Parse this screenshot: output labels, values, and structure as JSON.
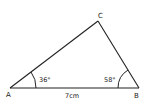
{
  "diagram": {
    "type": "triangle",
    "vertices": {
      "A": {
        "label": "A",
        "x": 10,
        "y": 88
      },
      "B": {
        "label": "B",
        "x": 139,
        "y": 88
      },
      "C": {
        "label": "C",
        "x": 98,
        "y": 21
      }
    },
    "angles": {
      "A": {
        "label": "36°"
      },
      "B": {
        "label": "58°"
      }
    },
    "sides": {
      "AB": {
        "label": "7cm"
      }
    },
    "stroke_color": "#222222",
    "background": "#ffffff"
  }
}
